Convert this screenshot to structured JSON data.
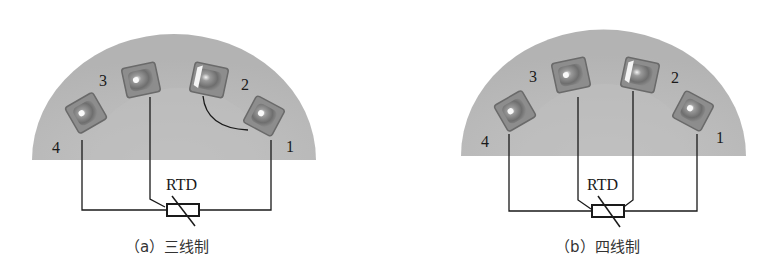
{
  "figures": [
    {
      "id": "a",
      "caption": "（a）三线制",
      "component_label": "RTD",
      "wiring": "3-wire",
      "terminals": [
        {
          "label": "1",
          "connected": true
        },
        {
          "label": "2",
          "connected": true,
          "jumper_to": "1"
        },
        {
          "label": "3",
          "connected": true
        },
        {
          "label": "4",
          "connected": true
        }
      ]
    },
    {
      "id": "b",
      "caption": "（b）四线制",
      "component_label": "RTD",
      "wiring": "4-wire",
      "terminals": [
        {
          "label": "1",
          "connected": true
        },
        {
          "label": "2",
          "connected": true
        },
        {
          "label": "3",
          "connected": true
        },
        {
          "label": "4",
          "connected": true
        }
      ]
    }
  ],
  "colors": {
    "terminal_block": "#b9b9b9",
    "wire": "#1a1a1a",
    "screw_dark": "#7a7a7a",
    "screw_light": "#f2f2f2"
  }
}
